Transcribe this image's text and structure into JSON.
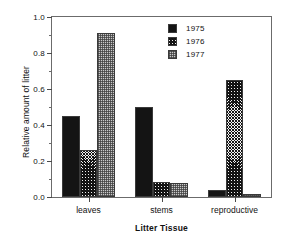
{
  "chart_data": {
    "type": "bar",
    "title": "",
    "subtitle": "",
    "xlabel": "Litter Tissue",
    "ylabel": "Relative amount of litter",
    "categories": [
      "leaves",
      "stems",
      "reproductive"
    ],
    "series": [
      {
        "name": "1975",
        "values": [
          0.45,
          0.5,
          0.04
        ],
        "fill": "solid-black",
        "color": "#141414"
      },
      {
        "name": "1976",
        "values": [
          0.26,
          0.085,
          0.65
        ],
        "fill": "diagonal-hatch",
        "color": "#2a2a2a"
      },
      {
        "name": "1977",
        "values": [
          0.91,
          0.08,
          0.015
        ],
        "fill": "gray-stipple",
        "color": "#c9c9c9"
      }
    ],
    "ylim": [
      0.0,
      1.0
    ],
    "ytick_labels": [
      "0.0",
      "0.2",
      "0.4",
      "0.6",
      "0.8",
      "1.0"
    ],
    "ytick_values": [
      0.0,
      0.2,
      0.4,
      0.6,
      0.8,
      1.0
    ],
    "yminor_values": [
      0.1,
      0.3,
      0.5,
      0.7,
      0.9
    ],
    "grid": false,
    "legend_position": "top-right",
    "legend_entries": [
      "1975",
      "1976",
      "1977"
    ],
    "frame": "full-box",
    "annotations": []
  },
  "axes": {
    "y_title": "Relative amount of litter",
    "x_title": "Litter Tissue"
  },
  "legend": {
    "items": [
      {
        "label": "1975"
      },
      {
        "label": "1976"
      },
      {
        "label": "1977"
      }
    ]
  }
}
